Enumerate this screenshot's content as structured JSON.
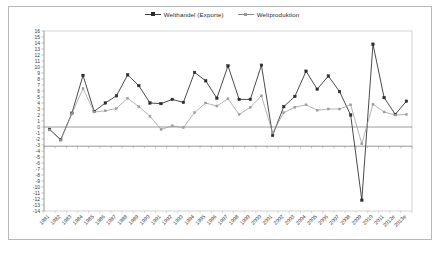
{
  "chart_data": {
    "type": "line",
    "title": "",
    "xlabel": "",
    "ylabel": "",
    "ylim": [
      -14,
      16
    ],
    "ytick_step": 1,
    "grid": false,
    "legend_position": "top-center",
    "categories": [
      "1981",
      "1982",
      "1983",
      "1984",
      "1985",
      "1986",
      "1987",
      "1988",
      "1989",
      "1990",
      "1991",
      "1992",
      "1993",
      "1994",
      "1995",
      "1996",
      "1997",
      "1998",
      "1999",
      "2000",
      "2001",
      "2002",
      "2003",
      "2004",
      "2005",
      "2006",
      "2007",
      "2008",
      "2009",
      "2010",
      "2011",
      "2012e",
      "2013e"
    ],
    "yticks": [
      "16",
      "15",
      "14",
      "13",
      "12",
      "11",
      "10",
      "9",
      "8",
      "7",
      "6",
      "5",
      "4",
      "3",
      "2",
      "1",
      "0",
      "-1",
      "-2",
      "-3",
      "-4",
      "-5",
      "-6",
      "-7",
      "-8",
      "-9",
      "-10",
      "-11",
      "-12",
      "-13",
      "-14"
    ],
    "series": [
      {
        "name": "Welthandel (Exporte)",
        "color": "#2b2b2b",
        "marker": "square",
        "values": [
          -0.4,
          -2.1,
          2.3,
          8.6,
          2.6,
          4.0,
          5.2,
          8.7,
          6.9,
          4.0,
          3.9,
          4.6,
          4.1,
          9.1,
          7.7,
          4.8,
          10.2,
          4.6,
          4.6,
          10.3,
          -1.4,
          3.4,
          5.1,
          9.3,
          6.3,
          8.5,
          5.9,
          2.0,
          -12.2,
          13.8,
          4.9,
          2.1,
          4.3
        ]
      },
      {
        "name": "Weltproduktion",
        "color": "#9a9a9a",
        "marker": "square-small",
        "values": [
          -0.5,
          -2.2,
          2.2,
          6.4,
          2.5,
          2.7,
          3.1,
          4.8,
          3.4,
          1.8,
          -0.4,
          0.2,
          -0.1,
          2.4,
          4.0,
          3.5,
          4.7,
          2.1,
          3.3,
          5.2,
          -1.0,
          2.4,
          3.3,
          3.7,
          2.8,
          3.0,
          3.0,
          3.7,
          -2.8,
          3.8,
          2.5,
          2.0,
          2.1
        ]
      }
    ]
  },
  "legend": {
    "items": [
      {
        "label": "Welthandel (Exporte)"
      },
      {
        "label": "Weltproduktion"
      }
    ]
  }
}
